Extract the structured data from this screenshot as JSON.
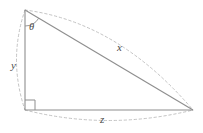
{
  "figure": {
    "background_color": "#ffffff",
    "stroke_color": "#8e8e8e",
    "dash_color": "#b8b8b8",
    "label_color": "#4a4a4a",
    "labels": {
      "angle": "θ",
      "vertical_leg": "y",
      "hypotenuse": "x",
      "horizontal_leg": "z"
    },
    "geometry": {
      "type": "right-triangle",
      "vertices": {
        "top_left": [
          25,
          10
        ],
        "bottom_left": [
          25,
          110
        ],
        "bottom_right": [
          193,
          110
        ]
      },
      "right_angle_at": "bottom_left",
      "labeled_angle_at": "top_left",
      "right_angle_marker_size": 10,
      "angle_arc_radius": 16
    },
    "annotations": {
      "dashed_arc_hypotenuse": "outward bulge above hypotenuse from top-left to bottom-right",
      "dashed_arc_vertical": "outward bulge left of vertical leg from top-left to bottom-left",
      "dashed_arc_horizontal": "outward bulge below base from bottom-left to bottom-right"
    }
  }
}
